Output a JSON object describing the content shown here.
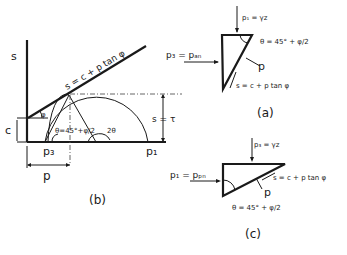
{
  "figure": {
    "panel_b": {
      "caption": "(b)",
      "axis_s": "s",
      "envelope_label": "s = c + p tan φ",
      "c_label": "c",
      "phi_label": "φ",
      "theta_label": "θ=45°+φ/2",
      "two_theta_label": "2θ",
      "shear_label": "s = τ",
      "p3_label": "p₃",
      "p1_label": "p₁",
      "p_label": "p"
    },
    "panel_a": {
      "caption": "(a)",
      "top_load": "p₁ = γz",
      "side_pressure": "p₃ = pₐₙ",
      "theta_label": "θ = 45° + φ/2",
      "p_label": "p",
      "shear_label": "s = c + p tan φ"
    },
    "panel_c": {
      "caption": "(c)",
      "top_load": "p₃ = γz",
      "side_pressure": "p₁ = pₚₙ",
      "theta_label": "θ = 45° + φ/2",
      "p_label": "p",
      "shear_label": "s = c + p tan φ"
    }
  }
}
